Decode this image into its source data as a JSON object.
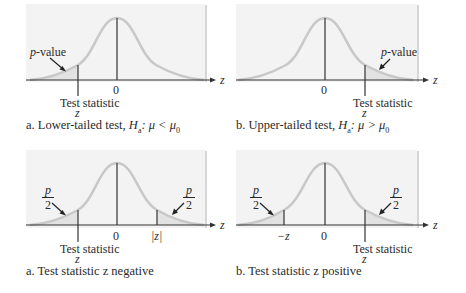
{
  "colors": {
    "panel_bg": "#f3f3f3",
    "panel_shadow": "#d6d6d6",
    "curve": "#c8c8c8",
    "tail_fill": "#e2e2e2",
    "axis": "#333333",
    "text": "#2a2a2a"
  },
  "panels": [
    {
      "id": "a-top",
      "tail_label": "p-value",
      "tick_zero": "0",
      "test_stat_label": "Test statistic",
      "test_stat_var": "z",
      "axis_var": "z",
      "caption_prefix": "a. Lower-tailed test, ",
      "caption_hyp": "H",
      "caption_hyp_sub": "a",
      "caption_rel": ": μ < μ",
      "caption_rel_sub": "0"
    },
    {
      "id": "b-top",
      "tail_label": "p-value",
      "tick_zero": "0",
      "test_stat_label": "Test statistic",
      "test_stat_var": "z",
      "axis_var": "z",
      "caption_prefix": "b. Upper-tailed test, ",
      "caption_hyp": "H",
      "caption_hyp_sub": "a",
      "caption_rel": ": μ > μ",
      "caption_rel_sub": "0"
    },
    {
      "id": "a-bottom",
      "tail_num": "p",
      "tail_den": "2",
      "tick_zero": "0",
      "mirror_label": "|z|",
      "test_stat_label": "Test statistic",
      "test_stat_var": "z",
      "axis_var": "z",
      "caption": "a. Test statistic z negative"
    },
    {
      "id": "b-bottom",
      "tail_num": "p",
      "tail_den": "2",
      "tick_zero": "0",
      "mirror_label": "−z",
      "test_stat_label": "Test statistic",
      "test_stat_var": "z",
      "axis_var": "z",
      "caption": "b. Test statistic z positive"
    }
  ]
}
